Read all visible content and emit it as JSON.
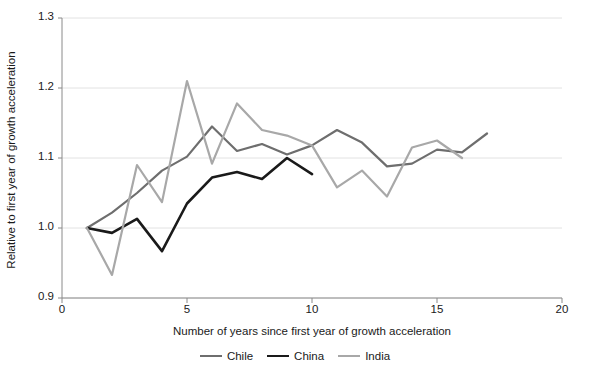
{
  "chart_data": {
    "type": "line",
    "title": "",
    "xlabel": "Number of years since first year of growth acceleration",
    "ylabel": "Relative to first year of growth acceleration",
    "xlim": [
      0,
      20
    ],
    "ylim": [
      0.9,
      1.3
    ],
    "xticks": [
      0,
      5,
      10,
      15,
      20
    ],
    "xtick_labels": [
      "0",
      "5",
      "10",
      "15",
      "20"
    ],
    "yticks": [
      0.9,
      1.0,
      1.1,
      1.2,
      1.3
    ],
    "ytick_labels": [
      "0.9",
      "1.0",
      "1.1",
      "1.2",
      "1.3"
    ],
    "grid": "horizontal",
    "legend_position": "bottom-center",
    "series": [
      {
        "name": "Chile",
        "color": "#6e6e6e",
        "width": 2.2,
        "x": [
          1,
          2,
          3,
          4,
          5,
          6,
          7,
          8,
          9,
          10,
          11,
          12,
          13,
          14,
          15,
          16,
          17
        ],
        "values": [
          1.0,
          1.022,
          1.05,
          1.082,
          1.102,
          1.145,
          1.11,
          1.12,
          1.105,
          1.118,
          1.14,
          1.122,
          1.088,
          1.092,
          1.112,
          1.108,
          1.135
        ]
      },
      {
        "name": "China",
        "color": "#1a1a1a",
        "width": 2.6,
        "x": [
          1,
          2,
          3,
          4,
          5,
          6,
          7,
          8,
          9,
          10
        ],
        "values": [
          1.0,
          0.993,
          1.013,
          0.967,
          1.035,
          1.072,
          1.08,
          1.07,
          1.1,
          1.077
        ]
      },
      {
        "name": "India",
        "color": "#a8a8a8",
        "width": 2.2,
        "x": [
          1,
          2,
          3,
          4,
          5,
          6,
          7,
          8,
          9,
          10,
          11,
          12,
          13,
          14,
          15,
          16
        ],
        "values": [
          1.0,
          0.933,
          1.09,
          1.037,
          1.21,
          1.092,
          1.178,
          1.14,
          1.132,
          1.118,
          1.058,
          1.082,
          1.045,
          1.115,
          1.125,
          1.1
        ]
      }
    ]
  },
  "legend": {
    "items": [
      {
        "label": "Chile",
        "color": "#6e6e6e",
        "width": 2.2
      },
      {
        "label": "China",
        "color": "#1a1a1a",
        "width": 2.6
      },
      {
        "label": "India",
        "color": "#a8a8a8",
        "width": 2.2
      }
    ]
  },
  "axes": {
    "axis_color": "#8a8a8a",
    "grid_color": "#e2e2e2"
  }
}
